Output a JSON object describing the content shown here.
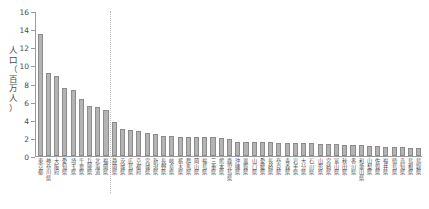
{
  "chart_data": {
    "type": "bar",
    "title": "",
    "xlabel": "",
    "ylabel": "人口\n（\n百\n万\n人\n）",
    "ylabel_plain": "人口（百万人）",
    "ylim": [
      0,
      16
    ],
    "yticks": [
      0,
      2,
      4,
      6,
      8,
      10,
      12,
      14,
      16
    ],
    "ytick_labels": [
      "0",
      "2",
      "4",
      "6",
      "8",
      "10",
      "12",
      "14",
      "16"
    ],
    "grid": false,
    "legend": "none",
    "bar_color": "#b4b4b4",
    "bar_edge_color": "#8c8c8c",
    "axis_color": "#9a9a9a",
    "divider_after_index": 9,
    "divider_color": "#bdbdbd",
    "categories": [
      "東京都",
      "神奈川県",
      "大阪府",
      "愛知県",
      "埼玉県",
      "千葉県",
      "兵庫県",
      "北海道",
      "福岡県",
      "静岡県",
      "茨城県",
      "広島県",
      "京都府",
      "宮城県",
      "新潟県",
      "長野県",
      "岐阜県",
      "栃木県",
      "群馬県",
      "岡山県",
      "福島県",
      "三重県",
      "熊本県",
      "鹿児島県",
      "沖縄県",
      "滋賀県",
      "山口県",
      "愛媛県",
      "長崎県",
      "奈良県",
      "青森県",
      "岩手県",
      "大分県",
      "石川県",
      "山形県",
      "宮崎県",
      "富山県",
      "秋田県",
      "香川県",
      "和歌山県",
      "山梨県",
      "佐賀県",
      "福井県",
      "徳島県",
      "高知県",
      "島根県",
      "鳥取県"
    ],
    "values": [
      13.5,
      9.13,
      8.84,
      7.45,
      7.27,
      6.25,
      5.56,
      5.38,
      5.13,
      3.77,
      3.0,
      2.88,
      2.73,
      2.5,
      2.4,
      2.2,
      2.17,
      2.1,
      2.07,
      2.06,
      2.06,
      2.05,
      1.96,
      1.9,
      1.56,
      1.54,
      1.53,
      1.52,
      1.52,
      1.49,
      1.45,
      1.44,
      1.4,
      1.39,
      1.33,
      1.3,
      1.28,
      1.27,
      1.25,
      1.19,
      1.1,
      1.06,
      1.02,
      1.0,
      0.97,
      0.91,
      0.83
    ]
  }
}
